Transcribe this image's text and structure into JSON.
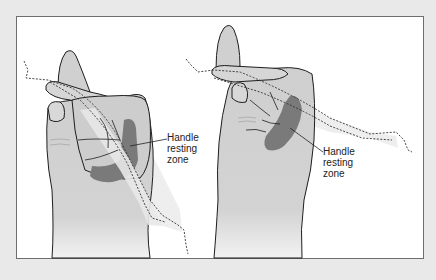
{
  "figure": {
    "background": "#ffffff",
    "page_background": "#e9e9e9",
    "border_color": "#6e6e6e",
    "skin_color": "#cfcfcf",
    "zone_color": "#7a7a7a",
    "handle_color": "#ececec",
    "outline_color": "#1e1e1e"
  },
  "left_hand": {
    "label": {
      "line1": "Handle",
      "line2": "resting",
      "line3": "zone"
    }
  },
  "right_hand": {
    "label": {
      "line1": "Handle",
      "line2": "resting",
      "line3": "zone"
    }
  }
}
